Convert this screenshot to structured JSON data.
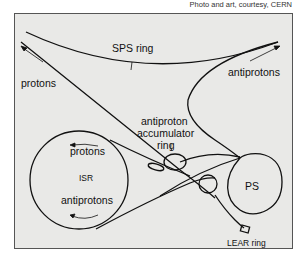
{
  "credit": "Photo and art, courtesy, CERN",
  "labels": {
    "sps_ring": "SPS ring",
    "protons_top": "protons",
    "antiprotons_top": "antiprotons",
    "accumulator": [
      "antiproton",
      "accumulator",
      "ring"
    ],
    "isr": "ISR",
    "isr_protons": "protons",
    "isr_antiprotons": "antiprotons",
    "ps": "PS",
    "lear": "LEAR ring"
  },
  "colors": {
    "background": "#e9e9e7",
    "line": "#111111",
    "border": "#555555"
  }
}
